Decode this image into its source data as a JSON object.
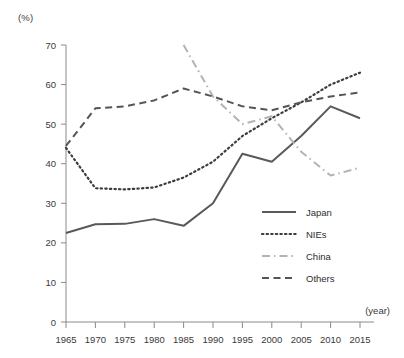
{
  "chart_data": {
    "type": "line",
    "title": "",
    "subtitle": "",
    "ylabel": "(%)",
    "xlabel": "(year)",
    "x": [
      1965,
      1970,
      1975,
      1980,
      1985,
      1990,
      1995,
      2000,
      2005,
      2010,
      2015
    ],
    "xlim": [
      1965,
      2015
    ],
    "ylim": [
      0,
      70
    ],
    "yticks": [
      0,
      10,
      20,
      30,
      40,
      50,
      60,
      70
    ],
    "xticks": [
      "1965",
      "1970",
      "1975",
      "1980",
      "1985",
      "1990",
      "1995",
      "2000",
      "2005",
      "2010",
      "2015"
    ],
    "grid": false,
    "legend_position": "inside-right-lower",
    "series": [
      {
        "name": "Japan",
        "style": "solid",
        "color": "#595959",
        "values": [
          22.5,
          24.7,
          24.8,
          26.0,
          24.3,
          30.0,
          42.5,
          40.5,
          47.0,
          54.5,
          51.5
        ]
      },
      {
        "name": "NIEs",
        "style": "dotted",
        "color": "#3c3c3c",
        "values": [
          44.0,
          33.8,
          33.5,
          34.0,
          36.5,
          40.5,
          47.0,
          51.5,
          55.5,
          60.0,
          63.0
        ]
      },
      {
        "name": "China",
        "style": "dash-dot",
        "color": "#b3b3b3",
        "values": [
          null,
          null,
          null,
          null,
          70.0,
          57.0,
          50.0,
          52.0,
          43.0,
          37.0,
          39.0
        ]
      },
      {
        "name": "Others",
        "style": "dashed",
        "color": "#555555",
        "values": [
          44.5,
          54.0,
          54.5,
          56.0,
          59.0,
          57.0,
          54.5,
          53.5,
          55.5,
          57.0,
          58.0
        ]
      }
    ]
  },
  "legend": {
    "items": [
      {
        "label": "Japan"
      },
      {
        "label": "NIEs"
      },
      {
        "label": "China"
      },
      {
        "label": "Others"
      }
    ]
  },
  "axes": {
    "y_unit": "(%)",
    "x_unit": "(year)"
  }
}
